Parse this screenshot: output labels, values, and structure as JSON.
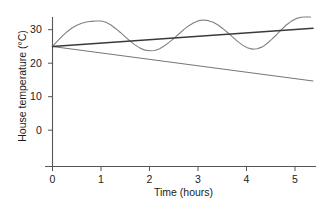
{
  "chart_data": {
    "type": "line",
    "title": "",
    "xlabel": "Time (hours)",
    "ylabel": "House temperature (°C)",
    "xlim": [
      0,
      5.4
    ],
    "ylim": [
      -4,
      35
    ],
    "xticks": [
      0,
      1,
      2,
      3,
      4,
      5
    ],
    "xtick_labels": [
      "0",
      "1",
      "2",
      "3",
      "4",
      "5"
    ],
    "yticks": [
      0,
      10,
      20,
      30
    ],
    "ytick_labels": [
      "0",
      "10",
      "20",
      "30"
    ],
    "grid": false,
    "legend": "none",
    "series": [
      {
        "name": "oscillating-temperature",
        "description": "Damped-free sinusoidal oscillation about a slowly rising mean, starting at 25 °C",
        "color": "#808080",
        "linewidth": 1.1,
        "x": [
          0,
          0.1,
          0.2,
          0.3,
          0.4,
          0.5,
          0.6,
          0.7,
          0.8,
          0.9,
          1,
          1.1,
          1.2,
          1.3,
          1.4,
          1.5,
          1.6,
          1.7,
          1.8,
          1.9,
          2,
          2.1,
          2.2,
          2.3,
          2.4,
          2.5,
          2.6,
          2.7,
          2.8,
          2.9,
          3,
          3.1,
          3.2,
          3.3,
          3.4,
          3.5,
          3.6,
          3.7,
          3.8,
          3.9,
          4,
          4.1,
          4.2,
          4.3,
          4.4,
          4.5,
          4.6,
          4.7,
          4.8,
          4.9,
          5,
          5.1,
          5.2,
          5.3
        ],
        "y": [
          25,
          26.6,
          28.1,
          29.4,
          30.5,
          31.3,
          31.9,
          32.3,
          32.5,
          32.6,
          32.6,
          32.2,
          31.4,
          30.3,
          29.1,
          27.8,
          26.5,
          25.4,
          24.5,
          23.9,
          23.7,
          23.8,
          24.3,
          25.2,
          26.3,
          27.5,
          28.8,
          30.1,
          31.2,
          32.1,
          32.7,
          32.9,
          32.7,
          32.2,
          31.4,
          30.3,
          29.1,
          27.8,
          26.5,
          25.4,
          24.6,
          24.2,
          24.3,
          24.8,
          25.8,
          27.1,
          28.5,
          30.0,
          31.4,
          32.5,
          33.3,
          33.7,
          33.8,
          33.8
        ]
      },
      {
        "name": "rising-trend-line",
        "description": "Straight line rising from 25 °C at 0 h to about 30 °C at 5 h",
        "color": "#3a3a3a",
        "linewidth": 1.5,
        "x": [
          0,
          5.35
        ],
        "y": [
          25,
          30.4
        ]
      },
      {
        "name": "falling-trend-line",
        "description": "Straight line falling from 25 °C at 0 h to about 15 °C at 5 h",
        "color": "#777777",
        "linewidth": 1.1,
        "x": [
          0,
          5.35
        ],
        "y": [
          25,
          14.7
        ]
      }
    ],
    "annotations": [],
    "axis_color": "#555555",
    "background": "#ffffff"
  },
  "axes": {
    "y_title": "House temperature (°C)",
    "x_title": "Time (hours)",
    "y_tick_0": "0",
    "y_tick_1": "10",
    "y_tick_2": "20",
    "y_tick_3": "30",
    "x_tick_0": "0",
    "x_tick_1": "1",
    "x_tick_2": "2",
    "x_tick_3": "3",
    "x_tick_4": "4",
    "x_tick_5": "5"
  }
}
